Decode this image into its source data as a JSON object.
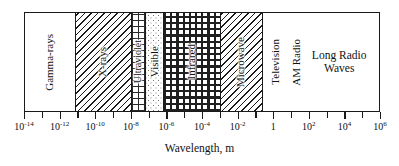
{
  "chart_data": {
    "type": "bar",
    "title": "",
    "xlabel": "Wavelength, m",
    "ylabel": "",
    "axis_scale": "log10",
    "xlim": [
      -14,
      6
    ],
    "grid": false,
    "legend": "none",
    "tick_labels": [
      "10-14",
      "10-12",
      "10-10",
      "10-8",
      "10-6",
      "10-4",
      "10-2",
      "1",
      "102",
      "104",
      "106"
    ],
    "tick_exponents": [
      -14,
      -12,
      -10,
      -8,
      -6,
      -4,
      -2,
      0,
      2,
      4,
      6
    ],
    "bands": [
      {
        "name": "Gamma-rays",
        "label": "Gamma-rays",
        "fill": "blank",
        "orientation": "vertical",
        "start_exponent": -14,
        "end_exponent": -11.2
      },
      {
        "name": "X-rays",
        "label": "X-rays",
        "fill": "diagonal-hatch",
        "orientation": "vertical",
        "start_exponent": -11.2,
        "end_exponent": -8.0
      },
      {
        "name": "Ultraviolet",
        "label": "Ultraviolet",
        "fill": "grid",
        "orientation": "vertical",
        "start_exponent": -8.0,
        "end_exponent": -7.2
      },
      {
        "name": "Visible",
        "label": "Visible",
        "fill": "stipple",
        "orientation": "vertical",
        "start_exponent": -7.2,
        "end_exponent": -6.2
      },
      {
        "name": "Infrared",
        "label": "Infrared",
        "fill": "cross",
        "orientation": "vertical",
        "start_exponent": -6.2,
        "end_exponent": -3.0
      },
      {
        "name": "Microwave",
        "label": "Microwave",
        "fill": "diagonal-hatch",
        "orientation": "vertical",
        "start_exponent": -3.0,
        "end_exponent": -0.6
      },
      {
        "name": "Radio",
        "label": "",
        "fill": "blank",
        "orientation": "mixed",
        "start_exponent": -0.6,
        "end_exponent": 6
      }
    ],
    "radio_sublabels": [
      {
        "name": "Television",
        "label": "Television",
        "orientation": "vertical"
      },
      {
        "name": "AM Radio",
        "label": "AM Radio",
        "orientation": "vertical"
      },
      {
        "name": "Long Radio Waves",
        "label": "Long Radio\nWaves",
        "orientation": "horizontal"
      }
    ]
  },
  "figure": {
    "xlabel": "Wavelength, m",
    "bands": {
      "gamma": "Gamma-rays",
      "xray": "X-rays",
      "ultraviolet": "Ultraviolet",
      "visible": "Visible",
      "infrared": "Infrared",
      "microwave": "Microwave",
      "television": "Television",
      "am_radio": "AM Radio",
      "long_radio_line1": "Long Radio",
      "long_radio_line2": "Waves"
    },
    "ticks": [
      {
        "mantissa": "10",
        "exponent": "-14"
      },
      {
        "mantissa": "10",
        "exponent": "-12"
      },
      {
        "mantissa": "10",
        "exponent": "-10"
      },
      {
        "mantissa": "10",
        "exponent": "-8"
      },
      {
        "mantissa": "10",
        "exponent": "-6"
      },
      {
        "mantissa": "10",
        "exponent": "-4"
      },
      {
        "mantissa": "10",
        "exponent": "-2"
      },
      {
        "mantissa": "1",
        "exponent": ""
      },
      {
        "mantissa": "10",
        "exponent": "2"
      },
      {
        "mantissa": "10",
        "exponent": "4"
      },
      {
        "mantissa": "10",
        "exponent": "6"
      }
    ]
  },
  "colors": {
    "ink": "#1a1a1a",
    "background": "#ffffff"
  }
}
